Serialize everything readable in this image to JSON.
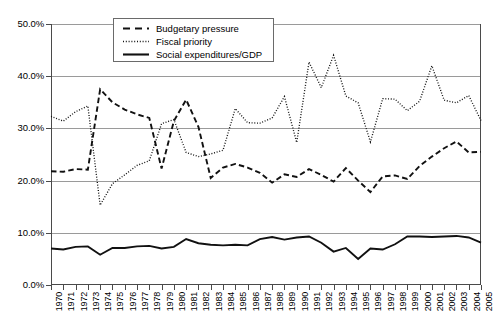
{
  "chart_data": {
    "type": "line",
    "title": "",
    "xlabel": "",
    "ylabel": "",
    "ylim": [
      0,
      50
    ],
    "ytick_labels": [
      "0.0%",
      "10.0%",
      "20.0%",
      "30.0%",
      "40.0%",
      "50.0%"
    ],
    "ytick_values": [
      0,
      10,
      20,
      30,
      40,
      50
    ],
    "grid": true,
    "legend_position": "top-center",
    "x": [
      1970,
      1971,
      1972,
      1973,
      1974,
      1975,
      1976,
      1977,
      1978,
      1979,
      1980,
      1981,
      1982,
      1983,
      1984,
      1985,
      1986,
      1987,
      1988,
      1989,
      1990,
      1991,
      1992,
      1993,
      1994,
      1995,
      1996,
      1997,
      1998,
      1999,
      2000,
      2001,
      2002,
      2003,
      2004,
      2005
    ],
    "categories": [
      "1970",
      "1971",
      "1972",
      "1973",
      "1974",
      "1975",
      "1976",
      "1977",
      "1978",
      "1979",
      "1980",
      "1981",
      "1982",
      "1983",
      "1984",
      "1985",
      "1986",
      "1987",
      "1988",
      "1989",
      "1990",
      "1991",
      "1992",
      "1993",
      "1994",
      "1995",
      "1996",
      "1997",
      "1998",
      "1999",
      "2000",
      "2001",
      "2002",
      "2003",
      "2004",
      "2005"
    ],
    "series": [
      {
        "name": "Budgetary pressure",
        "style": "dashed",
        "values": [
          21.8,
          21.7,
          22.2,
          22.1,
          37.5,
          35.0,
          33.6,
          32.7,
          32.0,
          22.3,
          31.4,
          35.5,
          30.3,
          20.5,
          22.5,
          23.2,
          22.5,
          21.5,
          19.6,
          21.2,
          20.7,
          22.2,
          21.1,
          19.8,
          22.4,
          20.0,
          17.8,
          20.8,
          21.0,
          20.3,
          22.8,
          24.6,
          26.2,
          27.5,
          25.4,
          25.5
        ]
      },
      {
        "name": "Fiscal priority",
        "style": "dotted",
        "values": [
          32.3,
          31.4,
          33.2,
          34.3,
          15.3,
          19.4,
          21.1,
          22.9,
          23.8,
          30.9,
          31.7,
          25.4,
          24.6,
          25.1,
          25.8,
          33.8,
          31.1,
          31.0,
          32.0,
          36.1,
          27.3,
          42.7,
          37.8,
          44.0,
          36.2,
          34.9,
          27.4,
          35.7,
          35.6,
          33.4,
          35.2,
          42.0,
          35.4,
          34.9,
          36.3,
          31.5
        ]
      },
      {
        "name": "Social expenditures/GDP",
        "style": "solid",
        "values": [
          7.0,
          6.8,
          7.3,
          7.4,
          5.8,
          7.1,
          7.1,
          7.4,
          7.5,
          7.0,
          7.3,
          8.8,
          8.0,
          7.7,
          7.6,
          7.7,
          7.6,
          8.8,
          9.2,
          8.7,
          9.1,
          9.3,
          8.1,
          6.4,
          7.1,
          5.0,
          7.0,
          6.8,
          7.8,
          9.3,
          9.3,
          9.2,
          9.3,
          9.4,
          9.1,
          8.1
        ]
      }
    ]
  },
  "legend": {
    "items": [
      {
        "label": "Budgetary pressure",
        "key": "dashed-line-key"
      },
      {
        "label": "Fiscal priority",
        "key": "dotted-line-key"
      },
      {
        "label": "Social expenditures/GDP",
        "key": "solid-line-key"
      }
    ]
  },
  "colors": {
    "series_stroke": "#111111",
    "gridline": "#9a9a9a",
    "axis": "#4a4a4a",
    "background": "#ffffff"
  }
}
